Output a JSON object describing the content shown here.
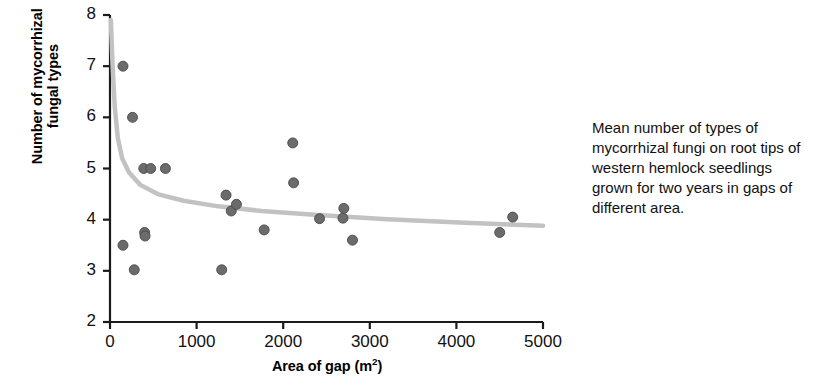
{
  "caption": {
    "text": "Mean number of types of mycorrhizal fungi on root tips of western hemlock seedlings grown for two years in gaps of different area."
  },
  "colors": {
    "marker": "#6b6b6b",
    "marker_edge": "#4a4a4a",
    "trendline": "#c2c2c2",
    "axis": "#1a1a1a",
    "background": "#ffffff"
  },
  "chart_data": {
    "type": "scatter",
    "title": "",
    "xlabel": "Area of gap (m2)",
    "xlabel_display": "Area of gap (m",
    "xlabel_sup": "2",
    "xlabel_tail": ")",
    "ylabel_line1": "Number of mycorrhizal",
    "ylabel_line2": "fungal types",
    "xlim": [
      0,
      5000
    ],
    "ylim": [
      2,
      8
    ],
    "xticks": [
      0,
      1000,
      2000,
      3000,
      4000,
      5000
    ],
    "yticks": [
      2,
      3,
      4,
      5,
      6,
      7,
      8
    ],
    "xtick_labels": [
      "0",
      "1000",
      "2000",
      "3000",
      "4000",
      "5000"
    ],
    "ytick_labels": [
      "2",
      "3",
      "4",
      "5",
      "6",
      "7",
      "8"
    ],
    "grid": false,
    "legend": false,
    "series": [
      {
        "name": "Mycorrhizal fungal types per gap",
        "marker": "circle",
        "points": [
          {
            "x": 150,
            "y": 7.0
          },
          {
            "x": 150,
            "y": 3.5
          },
          {
            "x": 260,
            "y": 6.0
          },
          {
            "x": 280,
            "y": 3.02
          },
          {
            "x": 390,
            "y": 5.0
          },
          {
            "x": 400,
            "y": 3.75
          },
          {
            "x": 405,
            "y": 3.68
          },
          {
            "x": 470,
            "y": 5.0
          },
          {
            "x": 640,
            "y": 5.0
          },
          {
            "x": 1290,
            "y": 3.02
          },
          {
            "x": 1340,
            "y": 4.48
          },
          {
            "x": 1400,
            "y": 4.17
          },
          {
            "x": 1460,
            "y": 4.3
          },
          {
            "x": 1780,
            "y": 3.8
          },
          {
            "x": 2110,
            "y": 5.5
          },
          {
            "x": 2120,
            "y": 4.72
          },
          {
            "x": 2420,
            "y": 4.02
          },
          {
            "x": 2690,
            "y": 4.03
          },
          {
            "x": 2700,
            "y": 4.22
          },
          {
            "x": 2800,
            "y": 3.6
          },
          {
            "x": 4500,
            "y": 3.75
          },
          {
            "x": 4650,
            "y": 4.05
          }
        ]
      }
    ],
    "trend": {
      "type": "power-decay",
      "description": "Fitted decaying curve from about y=7.6 near x=0 levelling to about y=3.88 at x=5000",
      "path_points": [
        {
          "x": 10,
          "y": 7.9
        },
        {
          "x": 30,
          "y": 7.0
        },
        {
          "x": 55,
          "y": 6.2
        },
        {
          "x": 90,
          "y": 5.6
        },
        {
          "x": 140,
          "y": 5.2
        },
        {
          "x": 220,
          "y": 4.92
        },
        {
          "x": 350,
          "y": 4.68
        },
        {
          "x": 550,
          "y": 4.5
        },
        {
          "x": 850,
          "y": 4.37
        },
        {
          "x": 1250,
          "y": 4.26
        },
        {
          "x": 1750,
          "y": 4.17
        },
        {
          "x": 2400,
          "y": 4.09
        },
        {
          "x": 3200,
          "y": 4.01
        },
        {
          "x": 4100,
          "y": 3.94
        },
        {
          "x": 5000,
          "y": 3.88
        }
      ]
    }
  }
}
